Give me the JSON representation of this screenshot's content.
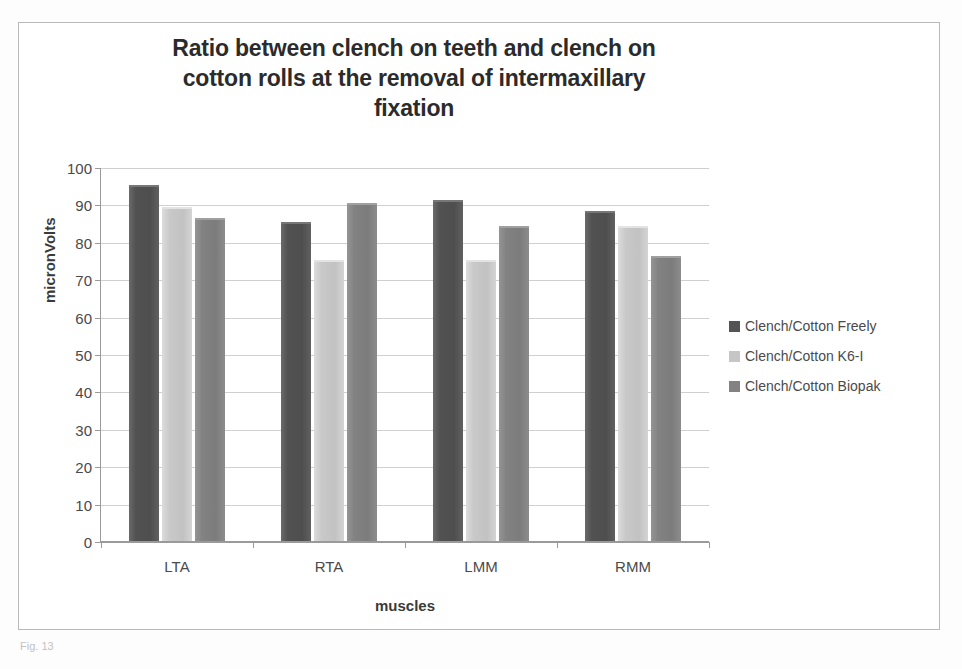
{
  "figure": {
    "caption": "Fig. 13"
  },
  "legend": {
    "position": "right",
    "items": [
      {
        "label": "Clench/Cotton Freely",
        "color": "#545454"
      },
      {
        "label": "Clench/Cotton K6-I",
        "color": "#c6c6c6"
      },
      {
        "label": "Clench/Cotton Biopak",
        "color": "#828282"
      }
    ]
  },
  "chart_data": {
    "type": "bar",
    "title": "Ratio between clench on teeth and clench on cotton rolls at the removal of intermaxillary fixation",
    "title_lines": [
      "Ratio between clench on teeth and clench on",
      "cotton rolls at the removal of intermaxillary",
      "fixation"
    ],
    "xlabel": "muscles",
    "ylabel": "micronVolts",
    "categories": [
      "LTA",
      "RTA",
      "LMM",
      "RMM"
    ],
    "ylim": [
      0,
      100
    ],
    "yticks": [
      0,
      10,
      20,
      30,
      40,
      50,
      60,
      70,
      80,
      90,
      100
    ],
    "grid": true,
    "series": [
      {
        "name": "Clench/Cotton Freely",
        "color": "#545454",
        "values": [
          95,
          85,
          91,
          88
        ]
      },
      {
        "name": "Clench/Cotton K6-I",
        "color": "#c6c6c6",
        "values": [
          89,
          75,
          75,
          84
        ]
      },
      {
        "name": "Clench/Cotton Biopak",
        "color": "#828282",
        "values": [
          86,
          90,
          84,
          76
        ]
      }
    ]
  }
}
